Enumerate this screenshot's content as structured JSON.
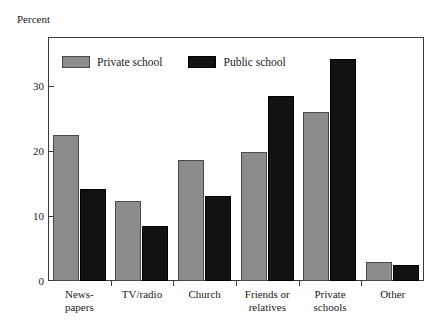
{
  "chart_data": {
    "type": "bar",
    "title": "",
    "subtitle": "",
    "xlabel": "",
    "ylabel": "Percent",
    "ylim": [
      0,
      37.5
    ],
    "yticks": [
      0,
      10,
      20,
      30
    ],
    "ytick_labels": [
      "0",
      "10",
      "20",
      "30"
    ],
    "grid": false,
    "legend_position": "top-left-inside",
    "categories": [
      "News-\npapers",
      "TV/radio",
      "Church",
      "Friends or\nrelatives",
      "Private\nschools",
      "Other"
    ],
    "category_lines": [
      [
        "News-",
        "papers"
      ],
      [
        "TV/radio",
        ""
      ],
      [
        "Church",
        ""
      ],
      [
        "Friends or",
        "relatives"
      ],
      [
        "Private",
        "schools"
      ],
      [
        "Other",
        ""
      ]
    ],
    "series": [
      {
        "name": "Private school",
        "color": "#8c8c8c",
        "values": [
          22.4,
          12.3,
          18.6,
          19.9,
          25.9,
          2.9
        ]
      },
      {
        "name": "Public school",
        "color": "#121212",
        "values": [
          14.1,
          8.5,
          13.0,
          28.5,
          34.1,
          2.5
        ]
      }
    ]
  },
  "legend": {
    "items": [
      {
        "label": "Private school",
        "swatch": "private"
      },
      {
        "label": "Public school",
        "swatch": "public"
      }
    ]
  },
  "axes": {
    "y_title": "Percent"
  },
  "colors": {
    "private": "#8c8c8c",
    "public": "#121212",
    "frame": "#3a3a3a",
    "background": "#ffffff"
  }
}
